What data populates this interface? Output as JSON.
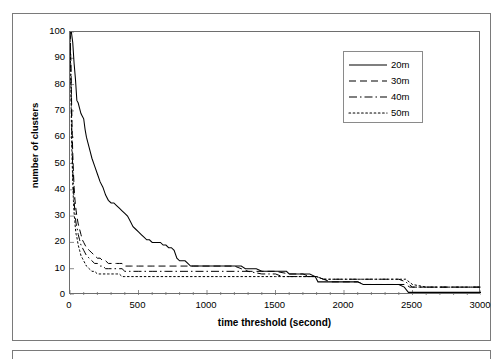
{
  "chart_data": {
    "type": "line",
    "title": "",
    "subtitle": "",
    "xlabel": "time threshold (second)",
    "ylabel": "number of clusters",
    "xlim": [
      0,
      3000
    ],
    "ylim": [
      0,
      100
    ],
    "x_ticks": [
      0,
      500,
      1000,
      1500,
      2000,
      2500,
      3000
    ],
    "x_minor_tick_step": 100,
    "y_ticks": [
      0,
      10,
      20,
      30,
      40,
      50,
      60,
      70,
      80,
      90,
      100
    ],
    "grid": false,
    "legend_position": "top-right-inside",
    "annotations": [],
    "series": [
      {
        "name": "20m",
        "style": "solid",
        "color": "#000000",
        "points": [
          [
            0,
            100
          ],
          [
            10,
            100
          ],
          [
            20,
            96
          ],
          [
            30,
            88
          ],
          [
            40,
            82
          ],
          [
            50,
            74
          ],
          [
            60,
            73
          ],
          [
            70,
            71
          ],
          [
            80,
            69
          ],
          [
            90,
            68
          ],
          [
            100,
            67
          ],
          [
            110,
            63
          ],
          [
            120,
            60
          ],
          [
            140,
            56
          ],
          [
            160,
            52
          ],
          [
            180,
            49
          ],
          [
            200,
            46
          ],
          [
            220,
            43
          ],
          [
            240,
            41
          ],
          [
            260,
            38
          ],
          [
            280,
            36
          ],
          [
            300,
            35
          ],
          [
            320,
            35
          ],
          [
            340,
            34
          ],
          [
            360,
            33
          ],
          [
            380,
            32
          ],
          [
            400,
            31
          ],
          [
            420,
            30
          ],
          [
            440,
            28
          ],
          [
            460,
            26
          ],
          [
            480,
            25
          ],
          [
            500,
            24
          ],
          [
            520,
            23
          ],
          [
            540,
            22
          ],
          [
            560,
            21
          ],
          [
            580,
            21
          ],
          [
            600,
            20
          ],
          [
            620,
            20
          ],
          [
            640,
            20
          ],
          [
            660,
            20
          ],
          [
            680,
            19
          ],
          [
            700,
            19
          ],
          [
            720,
            18
          ],
          [
            740,
            18
          ],
          [
            760,
            17
          ],
          [
            780,
            14
          ],
          [
            800,
            13
          ],
          [
            820,
            13
          ],
          [
            840,
            13
          ],
          [
            860,
            12
          ],
          [
            880,
            11
          ],
          [
            900,
            11
          ],
          [
            950,
            11
          ],
          [
            1000,
            11
          ],
          [
            1050,
            11
          ],
          [
            1100,
            11
          ],
          [
            1150,
            11
          ],
          [
            1200,
            11
          ],
          [
            1250,
            11
          ],
          [
            1280,
            10
          ],
          [
            1320,
            10
          ],
          [
            1360,
            10
          ],
          [
            1400,
            9
          ],
          [
            1450,
            9
          ],
          [
            1500,
            9
          ],
          [
            1550,
            9
          ],
          [
            1580,
            9
          ],
          [
            1600,
            8
          ],
          [
            1650,
            8
          ],
          [
            1700,
            8
          ],
          [
            1750,
            8
          ],
          [
            1790,
            7
          ],
          [
            1810,
            5
          ],
          [
            1850,
            5
          ],
          [
            1900,
            5
          ],
          [
            1950,
            5
          ],
          [
            2000,
            5
          ],
          [
            2050,
            5
          ],
          [
            2100,
            5
          ],
          [
            2140,
            4
          ],
          [
            2180,
            4
          ],
          [
            2250,
            4
          ],
          [
            2300,
            4
          ],
          [
            2350,
            4
          ],
          [
            2400,
            4
          ],
          [
            2440,
            3
          ],
          [
            2470,
            1
          ],
          [
            2500,
            1
          ],
          [
            2600,
            1
          ],
          [
            2700,
            1
          ],
          [
            2800,
            1
          ],
          [
            2900,
            1
          ],
          [
            3000,
            1
          ]
        ]
      },
      {
        "name": "30m",
        "style": "dashed",
        "color": "#000000",
        "points": [
          [
            0,
            100
          ],
          [
            5,
            92
          ],
          [
            10,
            78
          ],
          [
            15,
            64
          ],
          [
            20,
            54
          ],
          [
            25,
            47
          ],
          [
            30,
            41
          ],
          [
            35,
            37
          ],
          [
            40,
            34
          ],
          [
            45,
            32
          ],
          [
            50,
            30
          ],
          [
            60,
            27
          ],
          [
            70,
            25
          ],
          [
            80,
            23
          ],
          [
            90,
            21
          ],
          [
            100,
            20
          ],
          [
            110,
            19
          ],
          [
            120,
            18
          ],
          [
            140,
            17
          ],
          [
            160,
            16
          ],
          [
            180,
            15
          ],
          [
            200,
            14
          ],
          [
            220,
            14
          ],
          [
            240,
            13
          ],
          [
            260,
            13
          ],
          [
            280,
            12
          ],
          [
            300,
            12
          ],
          [
            320,
            12
          ],
          [
            340,
            12
          ],
          [
            360,
            12
          ],
          [
            380,
            12
          ],
          [
            400,
            11
          ],
          [
            450,
            11
          ],
          [
            500,
            11
          ],
          [
            600,
            11
          ],
          [
            700,
            11
          ],
          [
            800,
            11
          ],
          [
            900,
            11
          ],
          [
            1000,
            11
          ],
          [
            1100,
            11
          ],
          [
            1200,
            11
          ],
          [
            1250,
            10
          ],
          [
            1300,
            9
          ],
          [
            1400,
            9
          ],
          [
            1500,
            9
          ],
          [
            1600,
            8
          ],
          [
            1700,
            8
          ],
          [
            1750,
            7
          ],
          [
            1800,
            7
          ],
          [
            1850,
            6
          ],
          [
            1900,
            5
          ],
          [
            2000,
            5
          ],
          [
            2100,
            5
          ],
          [
            2150,
            4
          ],
          [
            2200,
            4
          ],
          [
            2300,
            4
          ],
          [
            2400,
            4
          ],
          [
            2450,
            4
          ],
          [
            2480,
            3
          ],
          [
            2500,
            3
          ],
          [
            2600,
            3
          ],
          [
            2700,
            3
          ],
          [
            2800,
            3
          ],
          [
            2900,
            3
          ],
          [
            3000,
            3
          ]
        ]
      },
      {
        "name": "40m",
        "style": "dashdot",
        "color": "#000000",
        "points": [
          [
            0,
            100
          ],
          [
            5,
            88
          ],
          [
            10,
            72
          ],
          [
            15,
            58
          ],
          [
            20,
            48
          ],
          [
            25,
            41
          ],
          [
            30,
            36
          ],
          [
            35,
            32
          ],
          [
            40,
            29
          ],
          [
            45,
            27
          ],
          [
            50,
            26
          ],
          [
            60,
            23
          ],
          [
            70,
            21
          ],
          [
            80,
            19
          ],
          [
            90,
            18
          ],
          [
            100,
            17
          ],
          [
            110,
            16
          ],
          [
            120,
            15
          ],
          [
            140,
            14
          ],
          [
            160,
            13
          ],
          [
            180,
            12
          ],
          [
            200,
            12
          ],
          [
            220,
            11
          ],
          [
            240,
            11
          ],
          [
            260,
            10
          ],
          [
            280,
            10
          ],
          [
            300,
            10
          ],
          [
            320,
            10
          ],
          [
            340,
            10
          ],
          [
            360,
            10
          ],
          [
            380,
            10
          ],
          [
            400,
            9
          ],
          [
            450,
            9
          ],
          [
            500,
            9
          ],
          [
            600,
            9
          ],
          [
            700,
            9
          ],
          [
            800,
            9
          ],
          [
            900,
            9
          ],
          [
            1000,
            9
          ],
          [
            1100,
            9
          ],
          [
            1200,
            9
          ],
          [
            1300,
            9
          ],
          [
            1400,
            8
          ],
          [
            1450,
            8
          ],
          [
            1500,
            8
          ],
          [
            1550,
            7
          ],
          [
            1600,
            7
          ],
          [
            1700,
            7
          ],
          [
            1800,
            7
          ],
          [
            1850,
            6
          ],
          [
            1900,
            6
          ],
          [
            2000,
            6
          ],
          [
            2100,
            6
          ],
          [
            2200,
            6
          ],
          [
            2300,
            6
          ],
          [
            2400,
            6
          ],
          [
            2450,
            5
          ],
          [
            2500,
            3
          ],
          [
            2600,
            3
          ],
          [
            2700,
            3
          ],
          [
            2800,
            3
          ],
          [
            2900,
            3
          ],
          [
            3000,
            3
          ]
        ]
      },
      {
        "name": "50m",
        "style": "dotted",
        "color": "#000000",
        "points": [
          [
            0,
            100
          ],
          [
            5,
            84
          ],
          [
            10,
            66
          ],
          [
            15,
            52
          ],
          [
            20,
            43
          ],
          [
            25,
            36
          ],
          [
            30,
            31
          ],
          [
            35,
            28
          ],
          [
            40,
            25
          ],
          [
            45,
            23
          ],
          [
            50,
            22
          ],
          [
            60,
            19
          ],
          [
            70,
            17
          ],
          [
            80,
            15
          ],
          [
            90,
            14
          ],
          [
            100,
            13
          ],
          [
            110,
            12
          ],
          [
            120,
            11
          ],
          [
            140,
            10
          ],
          [
            160,
            9
          ],
          [
            180,
            9
          ],
          [
            200,
            8
          ],
          [
            220,
            8
          ],
          [
            240,
            8
          ],
          [
            260,
            8
          ],
          [
            280,
            8
          ],
          [
            300,
            8
          ],
          [
            320,
            8
          ],
          [
            340,
            8
          ],
          [
            360,
            8
          ],
          [
            380,
            7
          ],
          [
            400,
            7
          ],
          [
            450,
            7
          ],
          [
            500,
            7
          ],
          [
            600,
            7
          ],
          [
            700,
            7
          ],
          [
            800,
            7
          ],
          [
            900,
            7
          ],
          [
            1000,
            7
          ],
          [
            1100,
            7
          ],
          [
            1200,
            7
          ],
          [
            1300,
            7
          ],
          [
            1400,
            7
          ],
          [
            1500,
            7
          ],
          [
            1600,
            7
          ],
          [
            1700,
            7
          ],
          [
            1800,
            7
          ],
          [
            1850,
            6
          ],
          [
            1900,
            6
          ],
          [
            2000,
            6
          ],
          [
            2100,
            6
          ],
          [
            2200,
            6
          ],
          [
            2300,
            6
          ],
          [
            2400,
            6
          ],
          [
            2450,
            6
          ],
          [
            2500,
            4
          ],
          [
            2600,
            3
          ],
          [
            2700,
            3
          ],
          [
            2800,
            3
          ],
          [
            2900,
            3
          ],
          [
            3000,
            3
          ]
        ]
      }
    ]
  },
  "axes": {
    "x_title": "time threshold (second)",
    "y_title": "number of clusters",
    "x_tick_labels": [
      "0",
      "500",
      "1000",
      "1500",
      "2000",
      "2500",
      "3000"
    ],
    "y_tick_labels": [
      "0",
      "10",
      "20",
      "30",
      "40",
      "50",
      "60",
      "70",
      "80",
      "90",
      "100"
    ]
  },
  "legend": {
    "entries": [
      {
        "label": "20m",
        "style": "solid"
      },
      {
        "label": "30m",
        "style": "dashed"
      },
      {
        "label": "40m",
        "style": "dashdot"
      },
      {
        "label": "50m",
        "style": "dotted"
      }
    ]
  },
  "colors": {
    "line": "#000000",
    "axis": "#6e6e6e",
    "frame": "#7a7a7a",
    "background": "#ffffff"
  }
}
